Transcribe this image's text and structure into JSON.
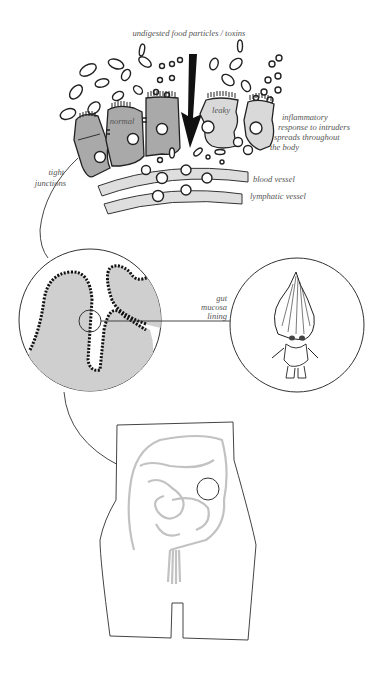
{
  "diagram": {
    "labels": {
      "top": "undigested food particles / toxins",
      "normal": "normal",
      "leaky": "leaky",
      "tight_junctions_1": "tight",
      "tight_junctions_2": "junctions",
      "inflammatory_1": "inflammatory",
      "inflammatory_2": "response to intruders",
      "inflammatory_3": "spreads throughout",
      "inflammatory_4": "the body",
      "blood_vessel": "blood vessel",
      "lymphatic_vessel": "lymphatic vessel",
      "gut_1": "gut",
      "gut_2": "mucosa",
      "gut_3": "lining"
    },
    "colors": {
      "normal_cell": "#a9a9a9",
      "leaky_cell": "#d9d9d9",
      "mucosa_fill": "#cfcfcf",
      "intestine": "#c2c2c2",
      "ink": "#222222"
    }
  }
}
